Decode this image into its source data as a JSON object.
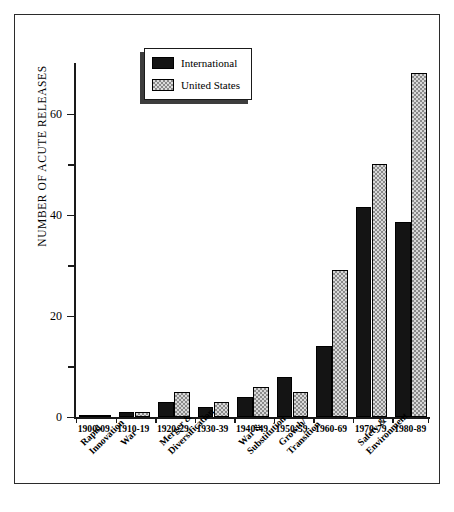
{
  "chart_data": {
    "type": "bar",
    "title": "",
    "xlabel": "",
    "ylabel": "NUMBER OF ACUTE RELEASES",
    "ylim": [
      0,
      70
    ],
    "yticks": [
      0,
      20,
      40,
      60
    ],
    "yticks_minor": [
      10,
      30,
      50
    ],
    "grid": false,
    "legend_position": "top-center-left",
    "categories": [
      "1900-09",
      "1910-19",
      "1920-29",
      "1930-39",
      "1940-49",
      "1950-59",
      "1960-69",
      "1970-79",
      "1980-89"
    ],
    "series": [
      {
        "name": "International",
        "color": "#141414",
        "values": [
          0.2,
          1,
          3,
          2,
          4,
          8,
          14,
          41.5,
          38.5
        ]
      },
      {
        "name": "United States",
        "color": "#d8d8d8",
        "values": [
          0.2,
          1,
          5,
          3,
          6,
          5,
          29,
          50,
          68
        ]
      }
    ],
    "era_annotations": [
      {
        "label": "Rapid Innovation",
        "lines": [
          "Rapid",
          "Innovation"
        ],
        "category_index": 0
      },
      {
        "label": "War",
        "lines": [
          "War"
        ],
        "category_index": 1
      },
      {
        "label": "Merger & Diversification",
        "lines": [
          "Merger &",
          "Diversification"
        ],
        "category_index": 2
      },
      {
        "label": "War & Substitution",
        "lines": [
          "War &",
          "Substitution"
        ],
        "category_index": 4
      },
      {
        "label": "Growth/Transition",
        "lines": [
          "Growth/",
          "Transition"
        ],
        "category_index": 5
      },
      {
        "label": "Safety & Environment",
        "lines": [
          "Safety &",
          "Environment"
        ],
        "category_index": 7
      }
    ]
  },
  "axis": {
    "y_title": "NUMBER OF ACUTE RELEASES",
    "tick_labels": [
      "60",
      "40",
      "20",
      "0"
    ]
  },
  "legend": {
    "items": [
      {
        "label": "International",
        "swatch": "black-fill-swatch"
      },
      {
        "label": "United States",
        "swatch": "dotted-fill-swatch"
      }
    ]
  }
}
